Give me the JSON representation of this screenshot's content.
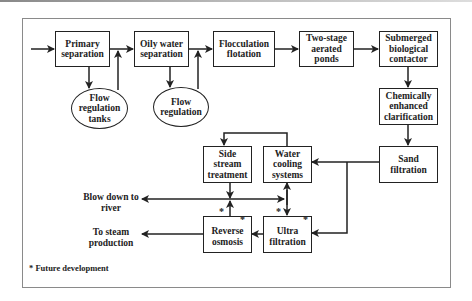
{
  "diagram": {
    "nodes": {
      "primary_separation": "Primary separation",
      "oily_water_separation": "Oily water separation",
      "flocculation_flotation": "Flocculation flotation",
      "two_stage_aerated_ponds": "Two-stage aerated ponds",
      "submerged_biological_contactor": "Submerged biological contactor",
      "chemically_enhanced_clarification": "Chemically enhanced clarification",
      "sand_filtration": "Sand filtration",
      "flow_regulation_tanks": "Flow regulation tanks",
      "flow_regulation": "Flow regulation",
      "side_stream_treatment": "Side stream treatment",
      "water_cooling_systems": "Water cooling systems",
      "reverse_osmosis": "Reverse osmosis",
      "ultra_filtration": "Ultra filtration"
    },
    "outputs": {
      "blow_down": "Blow down to river",
      "steam": "To steam production"
    },
    "future_marker": "*",
    "footnote": "* Future development",
    "edges": [
      [
        "input",
        "primary_separation"
      ],
      [
        "primary_separation",
        "flow_regulation_tanks"
      ],
      [
        "flow_regulation_tanks",
        "oily_water_separation"
      ],
      [
        "primary_separation",
        "oily_water_separation"
      ],
      [
        "oily_water_separation",
        "flow_regulation"
      ],
      [
        "flow_regulation",
        "flocculation_flotation"
      ],
      [
        "oily_water_separation",
        "flocculation_flotation"
      ],
      [
        "flocculation_flotation",
        "two_stage_aerated_ponds"
      ],
      [
        "two_stage_aerated_ponds",
        "submerged_biological_contactor"
      ],
      [
        "submerged_biological_contactor",
        "chemically_enhanced_clarification"
      ],
      [
        "chemically_enhanced_clarification",
        "sand_filtration"
      ],
      [
        "sand_filtration",
        "water_cooling_systems"
      ],
      [
        "sand_filtration",
        "ultra_filtration"
      ],
      [
        "water_cooling_systems",
        "side_stream_treatment"
      ],
      [
        "side_stream_treatment",
        "blow_down"
      ],
      [
        "water_cooling_systems",
        "ultra_filtration"
      ],
      [
        "ultra_filtration",
        "water_cooling_systems"
      ],
      [
        "ultra_filtration",
        "reverse_osmosis"
      ],
      [
        "reverse_osmosis",
        "side_stream_treatment"
      ],
      [
        "reverse_osmosis",
        "steam"
      ]
    ]
  }
}
